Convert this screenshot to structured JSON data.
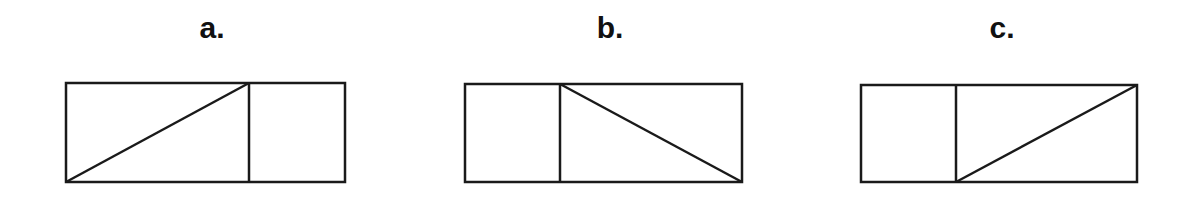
{
  "figure": {
    "stroke_color": "#1a1a1a",
    "stroke_width": 2.5,
    "panels": [
      {
        "label": "a.",
        "label_x": 212,
        "label_y": 13,
        "box": {
          "left": 66,
          "top": 83,
          "right": 345,
          "bottom": 182
        },
        "divider_x": 249,
        "diagonal": {
          "x1": 66,
          "y1": 182,
          "x2": 249,
          "y2": 83
        },
        "description": "Rectangle split by vertical line; diagonal in left section from bottom-left to top of divider"
      },
      {
        "label": "b.",
        "label_x": 610,
        "label_y": 13,
        "box": {
          "left": 465,
          "top": 84,
          "right": 742,
          "bottom": 182
        },
        "divider_x": 560,
        "diagonal": {
          "x1": 560,
          "y1": 84,
          "x2": 742,
          "y2": 182
        },
        "description": "Rectangle split by vertical line; diagonal in right section from top of divider to bottom-right"
      },
      {
        "label": "c.",
        "label_x": 1002,
        "label_y": 13,
        "box": {
          "left": 861,
          "top": 85,
          "right": 1137,
          "bottom": 182
        },
        "divider_x": 956,
        "diagonal": {
          "x1": 956,
          "y1": 182,
          "x2": 1137,
          "y2": 85
        },
        "description": "Rectangle split by vertical line; diagonal in right section from bottom of divider to top-right"
      }
    ]
  }
}
